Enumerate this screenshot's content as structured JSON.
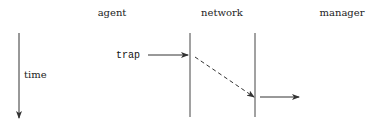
{
  "diagram": {
    "columns": [
      {
        "id": "agent",
        "label": "agent"
      },
      {
        "id": "network",
        "label": "network"
      },
      {
        "id": "manager",
        "label": "manager"
      }
    ],
    "time_axis": {
      "label": "time",
      "direction": "down"
    },
    "messages": [
      {
        "label": "trap",
        "from": "agent",
        "to": "network",
        "style": "solid"
      },
      {
        "label": "",
        "from": "network-left",
        "to": "network-right",
        "style": "dashed"
      },
      {
        "label": "",
        "from": "network",
        "to": "manager",
        "style": "solid"
      }
    ],
    "colors": {
      "line": "#333333",
      "text": "#222222",
      "background": "#ffffff"
    }
  }
}
